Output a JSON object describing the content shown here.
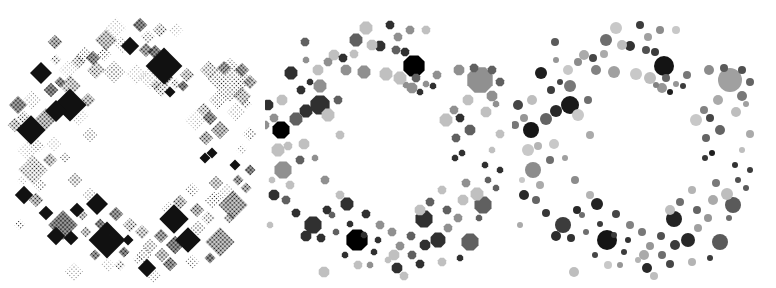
{
  "figure": {
    "panels": [
      {
        "id": "dithered",
        "style": "halftone-dither",
        "left": 0,
        "width": 265,
        "origin": 10
      },
      {
        "id": "posterized",
        "style": "posterized-polygons",
        "left": 265,
        "width": 247,
        "origin": 260
      },
      {
        "id": "smooth",
        "style": "smooth-circles",
        "left": 512,
        "width": 264,
        "origin": 510
      }
    ],
    "circles": [
      [
        154,
        66,
        10,
        20
      ],
      [
        60,
        105,
        9,
        25
      ],
      [
        21,
        130,
        8,
        22
      ],
      [
        31,
        73,
        6,
        30
      ],
      [
        46,
        111,
        6,
        40
      ],
      [
        97,
        240,
        10,
        20
      ],
      [
        164,
        219,
        8,
        35
      ],
      [
        178,
        240,
        7,
        40
      ],
      [
        53,
        225,
        8,
        60
      ],
      [
        87,
        204,
        6,
        35
      ],
      [
        220,
        80,
        12,
        160
      ],
      [
        23,
        170,
        8,
        140
      ],
      [
        223,
        205,
        8,
        90
      ],
      [
        210,
        242,
        8,
        90
      ],
      [
        137,
        268,
        5,
        40
      ],
      [
        130,
        25,
        4,
        60
      ],
      [
        120,
        46,
        5,
        50
      ],
      [
        96,
        40,
        6,
        110
      ],
      [
        106,
        28,
        6,
        200
      ],
      [
        74,
        55,
        5,
        170
      ],
      [
        45,
        42,
        4,
        90
      ],
      [
        60,
        86,
        6,
        120
      ],
      [
        41,
        90,
        4,
        60
      ],
      [
        36,
        119,
        6,
        100
      ],
      [
        8,
        105,
        5,
        70
      ],
      [
        5,
        125,
        4,
        120
      ],
      [
        18,
        150,
        6,
        200
      ],
      [
        44,
        144,
        5,
        200
      ],
      [
        40,
        160,
        4,
        110
      ],
      [
        14,
        195,
        5,
        40
      ],
      [
        26,
        200,
        4,
        100
      ],
      [
        10,
        225,
        3,
        170
      ],
      [
        46,
        236,
        5,
        45
      ],
      [
        36,
        213,
        4,
        55
      ],
      [
        67,
        210,
        4,
        40
      ],
      [
        61,
        238,
        4,
        50
      ],
      [
        72,
        215,
        3,
        110
      ],
      [
        106,
        214,
        4,
        70
      ],
      [
        120,
        225,
        4,
        130
      ],
      [
        132,
        232,
        4,
        120
      ],
      [
        134,
        255,
        5,
        170
      ],
      [
        114,
        252,
        3,
        60
      ],
      [
        98,
        265,
        4,
        200
      ],
      [
        64,
        272,
        5,
        190
      ],
      [
        151,
        236,
        4,
        80
      ],
      [
        165,
        245,
        5,
        60
      ],
      [
        160,
        264,
        4,
        70
      ],
      [
        200,
        258,
        3,
        60
      ],
      [
        198,
        218,
        4,
        150
      ],
      [
        219,
        218,
        3,
        110
      ],
      [
        217,
        194,
        6,
        190
      ],
      [
        206,
        183,
        4,
        120
      ],
      [
        228,
        180,
        3,
        80
      ],
      [
        225,
        165,
        3,
        50
      ],
      [
        202,
        153,
        3,
        30
      ],
      [
        195,
        158,
        3,
        55
      ],
      [
        196,
        138,
        4,
        100
      ],
      [
        210,
        130,
        5,
        100
      ],
      [
        200,
        118,
        4,
        70
      ],
      [
        186,
        120,
        6,
        200
      ],
      [
        208,
        100,
        5,
        170
      ],
      [
        194,
        110,
        4,
        130
      ],
      [
        232,
        96,
        5,
        120
      ],
      [
        240,
        82,
        4,
        100
      ],
      [
        232,
        70,
        4,
        80
      ],
      [
        214,
        68,
        4,
        90
      ],
      [
        199,
        70,
        5,
        140
      ],
      [
        177,
        75,
        4,
        120
      ],
      [
        166,
        84,
        3,
        150
      ],
      [
        173,
        86,
        3,
        60
      ],
      [
        160,
        92,
        3,
        30
      ],
      [
        152,
        88,
        5,
        150
      ],
      [
        156,
        78,
        4,
        100
      ],
      [
        146,
        85,
        3,
        130
      ],
      [
        136,
        50,
        4,
        80
      ],
      [
        145,
        52,
        4,
        60
      ],
      [
        138,
        37,
        4,
        160
      ],
      [
        140,
        78,
        6,
        190
      ],
      [
        166,
        30,
        4,
        200
      ],
      [
        150,
        30,
        4,
        140
      ],
      [
        126,
        74,
        6,
        200
      ],
      [
        104,
        72,
        6,
        160
      ],
      [
        86,
        70,
        5,
        130
      ],
      [
        83,
        58,
        4,
        70
      ],
      [
        68,
        62,
        4,
        140
      ],
      [
        50,
        82,
        3,
        70
      ],
      [
        78,
        100,
        4,
        110
      ],
      [
        68,
        115,
        6,
        200
      ],
      [
        80,
        135,
        4,
        170
      ],
      [
        28,
        146,
        4,
        180
      ],
      [
        55,
        158,
        3,
        160
      ],
      [
        12,
        180,
        3,
        200
      ],
      [
        30,
        185,
        4,
        170
      ],
      [
        80,
        195,
        4,
        180
      ],
      [
        65,
        180,
        4,
        140
      ],
      [
        90,
        224,
        3,
        60
      ],
      [
        104,
        235,
        3,
        60
      ],
      [
        118,
        240,
        3,
        50
      ],
      [
        160,
        210,
        5,
        190
      ],
      [
        188,
        228,
        4,
        160
      ],
      [
        170,
        202,
        4,
        110
      ],
      [
        187,
        210,
        4,
        100
      ],
      [
        182,
        190,
        4,
        180
      ],
      [
        203,
        200,
        5,
        170
      ],
      [
        236,
        188,
        3,
        90
      ],
      [
        240,
        170,
        3,
        60
      ],
      [
        232,
        150,
        3,
        190
      ],
      [
        240,
        134,
        4,
        170
      ],
      [
        226,
        112,
        5,
        190
      ],
      [
        236,
        104,
        3,
        160
      ],
      [
        152,
        255,
        4,
        110
      ],
      [
        128,
        260,
        3,
        180
      ],
      [
        144,
        276,
        4,
        190
      ],
      [
        182,
        262,
        4,
        180
      ],
      [
        110,
        265,
        3,
        150
      ],
      [
        85,
        255,
        3,
        70
      ],
      [
        76,
        232,
        3,
        110
      ],
      [
        140,
        246,
        4,
        150
      ],
      [
        112,
        45,
        5,
        190
      ],
      [
        94,
        54,
        4,
        170
      ],
      [
        58,
        70,
        5,
        200
      ],
      [
        46,
        60,
        3,
        150
      ],
      [
        22,
        100,
        5,
        190
      ],
      [
        14,
        118,
        4,
        150
      ]
    ]
  }
}
